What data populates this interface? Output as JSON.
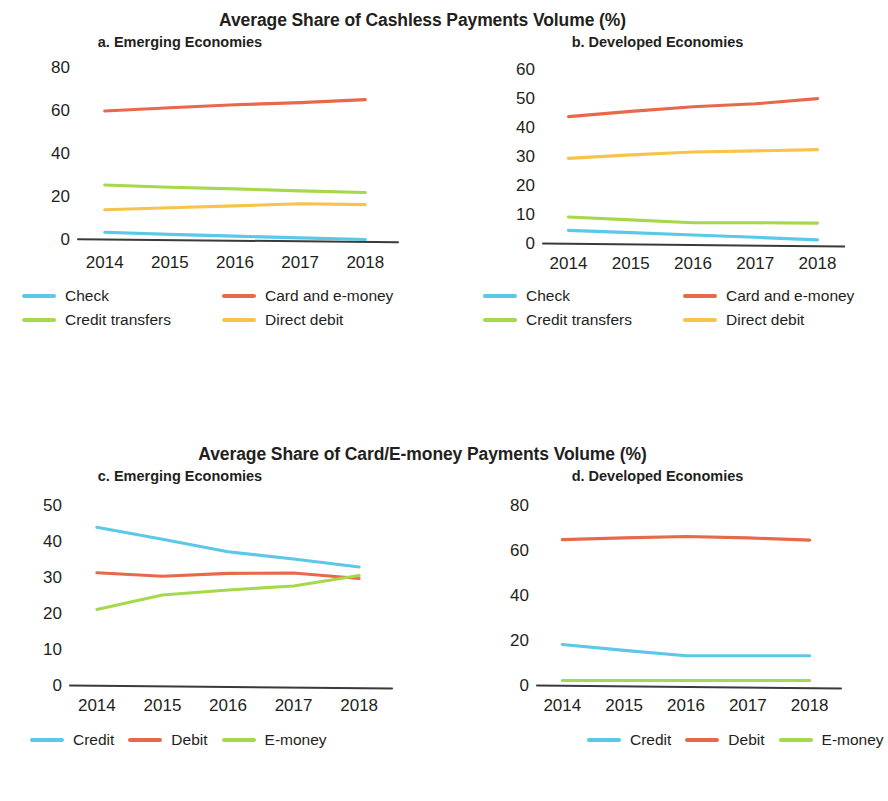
{
  "groups": [
    {
      "id": "cashless",
      "title": "Average Share of Cashless Payments Volume (%)",
      "panels": [
        {
          "id": "a",
          "title": "a. Emerging Economies",
          "legend": [
            {
              "label": "Check",
              "color": "#5BC8E8"
            },
            {
              "label": "Card and e-money",
              "color": "#E8694A"
            },
            {
              "label": "Credit transfers",
              "color": "#A5D84A"
            },
            {
              "label": "Direct debit",
              "color": "#F7C34A"
            }
          ]
        },
        {
          "id": "b",
          "title": "b. Developed Economies",
          "legend": [
            {
              "label": "Check",
              "color": "#5BC8E8"
            },
            {
              "label": "Card and e-money",
              "color": "#E8694A"
            },
            {
              "label": "Credit transfers",
              "color": "#A5D84A"
            },
            {
              "label": "Direct debit",
              "color": "#F7C34A"
            }
          ]
        }
      ]
    },
    {
      "id": "cardemoney",
      "title": "Average Share of Card/E-money Payments Volume (%)",
      "panels": [
        {
          "id": "c",
          "title": "c. Emerging Economies",
          "legend": [
            {
              "label": "Credit",
              "color": "#5BC8E8"
            },
            {
              "label": "Debit",
              "color": "#E8694A"
            },
            {
              "label": "E-money",
              "color": "#A5D84A"
            }
          ]
        },
        {
          "id": "d",
          "title": "d. Developed Economies",
          "legend": [
            {
              "label": "Credit",
              "color": "#5BC8E8"
            },
            {
              "label": "Debit",
              "color": "#E8694A"
            },
            {
              "label": "E-money",
              "color": "#A5D84A"
            }
          ]
        }
      ]
    }
  ],
  "chart_data": [
    {
      "id": "a",
      "type": "line",
      "title": "a. Emerging Economies",
      "suptitle": "Average Share of Cashless Payments Volume (%)",
      "xlabel": "",
      "ylabel": "",
      "x": [
        "2014",
        "2015",
        "2016",
        "2017",
        "2018"
      ],
      "xticklabels": [
        "2014",
        "2015",
        "2016",
        "2017",
        "2018"
      ],
      "yticks": [
        0,
        20,
        40,
        60,
        80
      ],
      "ylim": [
        -2,
        80
      ],
      "grid": false,
      "legend_position": "below",
      "series": [
        {
          "name": "Check",
          "color": "#5BC8E8",
          "values": [
            3.0,
            2.0,
            1.2,
            0.4,
            -0.4
          ]
        },
        {
          "name": "Card and e-money",
          "color": "#E8694A",
          "values": [
            59.5,
            61.0,
            62.4,
            63.4,
            64.8
          ]
        },
        {
          "name": "Credit transfers",
          "color": "#A5D84A",
          "values": [
            25.0,
            24.0,
            23.2,
            22.3,
            21.5
          ]
        },
        {
          "name": "Direct debit",
          "color": "#F7C34A",
          "values": [
            13.5,
            14.4,
            15.3,
            16.3,
            15.9
          ]
        }
      ]
    },
    {
      "id": "b",
      "type": "line",
      "title": "b. Developed Economies",
      "suptitle": "Average Share of Cashless Payments Volume (%)",
      "xlabel": "",
      "ylabel": "",
      "x": [
        "2014",
        "2015",
        "2016",
        "2017",
        "2018"
      ],
      "xticklabels": [
        "2014",
        "2015",
        "2016",
        "2017",
        "2018"
      ],
      "yticks": [
        0,
        10,
        20,
        30,
        40,
        50,
        60
      ],
      "ylim": [
        -1,
        60
      ],
      "grid": false,
      "legend_position": "below",
      "series": [
        {
          "name": "Check",
          "color": "#5BC8E8",
          "values": [
            4.4,
            3.6,
            2.8,
            2.0,
            1.1
          ]
        },
        {
          "name": "Card and e-money",
          "color": "#E8694A",
          "values": [
            43.6,
            45.4,
            47.0,
            48.0,
            49.8
          ]
        },
        {
          "name": "Credit transfers",
          "color": "#A5D84A",
          "values": [
            9.0,
            8.0,
            7.0,
            7.0,
            6.9
          ]
        },
        {
          "name": "Direct debit",
          "color": "#F7C34A",
          "values": [
            29.2,
            30.4,
            31.4,
            31.8,
            32.2
          ]
        }
      ]
    },
    {
      "id": "c",
      "type": "line",
      "title": "c. Emerging Economies",
      "suptitle": "Average Share of Card/E-money Payments Volume (%)",
      "xlabel": "",
      "ylabel": "",
      "x": [
        "2014",
        "2015",
        "2016",
        "2017",
        "2018"
      ],
      "xticklabels": [
        "2014",
        "2015",
        "2016",
        "2017",
        "2018"
      ],
      "yticks": [
        0,
        10,
        20,
        30,
        40,
        50
      ],
      "ylim": [
        0,
        50
      ],
      "grid": false,
      "legend_position": "below",
      "series": [
        {
          "name": "Credit",
          "color": "#5BC8E8",
          "values": [
            43.8,
            40.5,
            37.0,
            35.0,
            32.8
          ]
        },
        {
          "name": "Debit",
          "color": "#E8694A",
          "values": [
            31.2,
            30.2,
            31.0,
            31.1,
            29.6
          ]
        },
        {
          "name": "E-money",
          "color": "#A5D84A",
          "values": [
            21.0,
            25.0,
            26.4,
            27.5,
            30.4
          ]
        }
      ]
    },
    {
      "id": "d",
      "type": "line",
      "title": "d. Developed Economies",
      "suptitle": "Average Share of Card/E-money Payments Volume (%)",
      "xlabel": "",
      "ylabel": "",
      "x": [
        "2014",
        "2015",
        "2016",
        "2017",
        "2018"
      ],
      "xticklabels": [
        "2014",
        "2015",
        "2016",
        "2017",
        "2018"
      ],
      "yticks": [
        0,
        20,
        40,
        60,
        80
      ],
      "ylim": [
        0,
        80
      ],
      "grid": false,
      "legend_position": "below",
      "series": [
        {
          "name": "Credit",
          "color": "#5BC8E8",
          "values": [
            18.0,
            15.4,
            13.0,
            13.0,
            13.0
          ]
        },
        {
          "name": "Debit",
          "color": "#E8694A",
          "values": [
            64.6,
            65.4,
            66.0,
            65.4,
            64.4
          ]
        },
        {
          "name": "E-money",
          "color": "#A5D84A",
          "values": [
            2.0,
            2.0,
            2.0,
            2.0,
            2.0
          ]
        }
      ]
    }
  ]
}
